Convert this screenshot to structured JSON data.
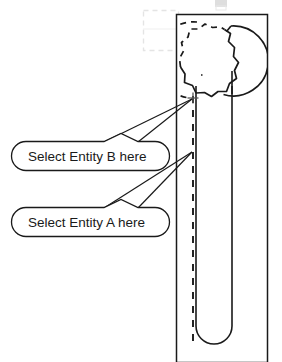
{
  "drawing": {
    "title": "Wrench entity selection diagram",
    "type": "cad-technical-drawing",
    "background_color": "#ffffff",
    "line_color": "#1a1a1a",
    "ghost_color": "#e2e2e2"
  },
  "viewport": {
    "name": "drawing-frame",
    "x": 176,
    "y": 14,
    "width": 92,
    "height": 348
  },
  "ghost_selection_box": {
    "name": "ghost-selection-rectangle",
    "x": 143,
    "y": 10,
    "width": 35,
    "height": 40,
    "color": "#e4e4e4"
  },
  "part": {
    "name": "box-end-wrench",
    "head": {
      "name": "twelve-point-socket",
      "center_x": 207,
      "center_y": 60,
      "points": 12,
      "outer_radius": 36,
      "inner_radius": 28
    },
    "handle": {
      "name": "wrench-handle",
      "left_x": 196,
      "right_x": 232,
      "top_y": 84,
      "bottom_y": 346,
      "cap": "round"
    },
    "centerline": {
      "name": "dashed-centerline",
      "x": 193,
      "y_start": 96,
      "y_end": 362,
      "style": "dashed"
    }
  },
  "pick_marker": {
    "name": "crosshair-pick-point",
    "x": 193,
    "y": 98,
    "size": 9
  },
  "callouts": [
    {
      "id": "entity-b",
      "label": "Select Entity B here",
      "box": {
        "x": 12,
        "y": 141,
        "width": 157,
        "height": 29,
        "radius": 14
      },
      "tail": {
        "notch_left": 104,
        "notch_apex_x": 121,
        "notch_right": 138
      },
      "leader_target": {
        "x": 193,
        "y": 99
      }
    },
    {
      "id": "entity-a",
      "label": "Select Entity A here",
      "box": {
        "x": 12,
        "y": 207,
        "width": 157,
        "height": 29,
        "radius": 14
      },
      "tail": {
        "notch_left": 104,
        "notch_apex_x": 121,
        "notch_right": 138
      },
      "leader_target": {
        "x": 193,
        "y": 152
      }
    }
  ],
  "top_artifact": {
    "name": "cropped-toolbar-artifact",
    "x": 214,
    "y": 0,
    "width": 14,
    "height": 8,
    "color": "#d8d8d8"
  }
}
